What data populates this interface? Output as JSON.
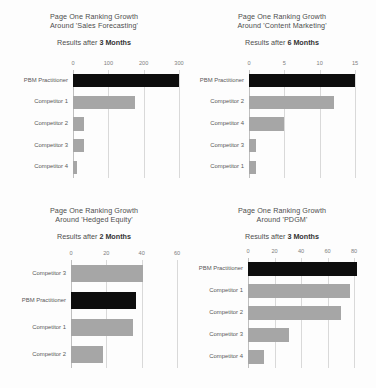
{
  "page": {
    "background": "#fdfdfd",
    "bar_color": "#a6a6a6",
    "highlight_color": "#0d0d0d",
    "grid_color": "#d9d9d9"
  },
  "chart_data": [
    {
      "id": "sales-forecasting",
      "type": "bar",
      "orientation": "horizontal",
      "title_line1": "Page One Ranking Growth",
      "title_line2": "Around 'Sales Forecasting'",
      "subtitle_prefix": "Results after ",
      "subtitle_strong": "3 Months",
      "categories": [
        "PBM Practitioner",
        "Competitor 1",
        "Competitor 2",
        "Competitor 3",
        "Competitor 4"
      ],
      "values": [
        300,
        175,
        30,
        32,
        12
      ],
      "highlight_index": 0,
      "xlabel": "",
      "ylabel": "",
      "xlim": [
        0,
        300
      ],
      "ticks": [
        0,
        100,
        200,
        300
      ],
      "tick_labels": [
        "0",
        "100",
        "200",
        "300"
      ],
      "grid": true,
      "legend": "none"
    },
    {
      "id": "content-marketing",
      "type": "bar",
      "orientation": "horizontal",
      "title_line1": "Page One Ranking Growth",
      "title_line2": "Around 'Content Marketing'",
      "subtitle_prefix": "Results after ",
      "subtitle_strong": "6 Months",
      "categories": [
        "PBM Practitioner",
        "Competitor 2",
        "Competitor 4",
        "Competitor 3",
        "Competitor 1"
      ],
      "values": [
        15,
        12,
        5,
        1,
        1
      ],
      "highlight_index": 0,
      "xlabel": "",
      "ylabel": "",
      "xlim": [
        0,
        15
      ],
      "ticks": [
        0,
        5,
        10,
        15
      ],
      "tick_labels": [
        "0",
        "5",
        "10",
        "15"
      ],
      "grid": true,
      "legend": "none"
    },
    {
      "id": "hedged-equity",
      "type": "bar",
      "orientation": "horizontal",
      "title_line1": "Page One Ranking Growth",
      "title_line2": "Around 'Hedged Equity'",
      "subtitle_prefix": "Results after ",
      "subtitle_strong": "2 Months",
      "categories": [
        "Competitor 3",
        "PBM Practitioner",
        "Competitor 1",
        "Competitor 2"
      ],
      "values": [
        41,
        37,
        35,
        18
      ],
      "highlight_index": 1,
      "xlabel": "",
      "ylabel": "",
      "xlim": [
        0,
        60
      ],
      "ticks": [
        0,
        20,
        40,
        60
      ],
      "tick_labels": [
        "0",
        "20",
        "40",
        "60"
      ],
      "grid": true,
      "legend": "none"
    },
    {
      "id": "pdgm",
      "type": "bar",
      "orientation": "horizontal",
      "title_line1": "Page One Ranking Growth",
      "title_line2": "Around 'PDGM'",
      "subtitle_prefix": "Results after ",
      "subtitle_strong": "3 Months",
      "categories": [
        "PBM Practitioner",
        "Competitor 1",
        "Competitor 2",
        "Competitor 3",
        "Competitor 4"
      ],
      "values": [
        82,
        77,
        70,
        31,
        12
      ],
      "highlight_index": 0,
      "xlabel": "",
      "ylabel": "",
      "xlim": [
        0,
        80
      ],
      "ticks": [
        0,
        20,
        40,
        60,
        80
      ],
      "tick_labels": [
        "0",
        "20",
        "40",
        "60",
        "80"
      ],
      "grid": true,
      "legend": "none"
    }
  ]
}
